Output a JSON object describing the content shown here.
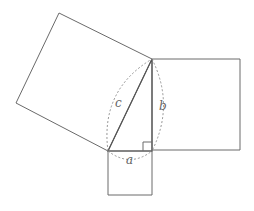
{
  "diagram": {
    "labels": {
      "a": "a",
      "b": "b",
      "c": "c"
    },
    "colors": {
      "stroke": "#6a6a6a",
      "label": "#666666",
      "background": "#ffffff"
    },
    "vertices": {
      "A": [
        108,
        151
      ],
      "C_right_angle": [
        152,
        151
      ],
      "B": [
        152,
        59
      ]
    },
    "squares": [
      {
        "side": "c",
        "points": [
          [
            108,
            151
          ],
          [
            152,
            59
          ],
          [
            59,
            13
          ],
          [
            16,
            103
          ]
        ]
      },
      {
        "side": "b",
        "points": [
          [
            152,
            59
          ],
          [
            240,
            59
          ],
          [
            240,
            150
          ],
          [
            152,
            150
          ]
        ]
      },
      {
        "side": "a",
        "points": [
          [
            108,
            151
          ],
          [
            152,
            151
          ],
          [
            152,
            195
          ],
          [
            108,
            195
          ]
        ]
      }
    ]
  }
}
